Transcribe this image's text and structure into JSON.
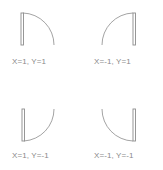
{
  "diagram": {
    "title": "",
    "stroke_color": "#8c8c8c",
    "label_color": "#8a8a8a",
    "doors": [
      {
        "x": 1,
        "y": 1,
        "label": "X=1, Y=1"
      },
      {
        "x": -1,
        "y": 1,
        "label": "X=-1, Y=1"
      },
      {
        "x": 1,
        "y": -1,
        "label": "X=1, Y=-1"
      },
      {
        "x": -1,
        "y": -1,
        "label": "X=-1, Y=-1"
      }
    ]
  }
}
